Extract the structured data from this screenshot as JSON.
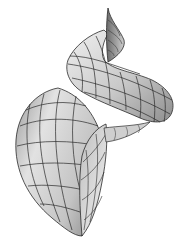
{
  "figure": {
    "caption": "",
    "colors": {
      "background": "#ffffff",
      "surface_light": "#e6e6e6",
      "surface_mid": "#bdbdbd",
      "surface_dark": "#8a8a8a",
      "grid_line": "#2a2a2a",
      "inner_surface": "#d9d9d9"
    },
    "parts": [
      {
        "id": "spire-tip",
        "label": "apex ribbon"
      },
      {
        "id": "upper-whorl",
        "label": "upper whorl tube"
      },
      {
        "id": "middle-whorl",
        "label": "middle whorl tube"
      },
      {
        "id": "aperture",
        "label": "aperture opening"
      }
    ]
  }
}
